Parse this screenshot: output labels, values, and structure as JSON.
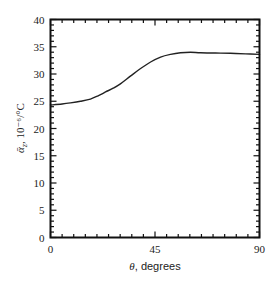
{
  "chart_data": {
    "type": "line",
    "title": "",
    "xlabel": "θ, degrees",
    "xlabel_symbol": "θ",
    "xlabel_text": ", degrees",
    "ylabel": "ᾱz, 10⁻⁶/°C",
    "ylabel_symbol": "ᾱ",
    "ylabel_sub": "z",
    "ylabel_text": ", 10⁻⁶/°C",
    "xlim": [
      0,
      90
    ],
    "ylim": [
      0,
      40
    ],
    "x_ticks": [
      0,
      45,
      90
    ],
    "x_tick_labels": [
      "0",
      "45",
      "90"
    ],
    "x_minor_step": 5,
    "y_ticks": [
      0,
      5,
      10,
      15,
      20,
      25,
      30,
      35,
      40
    ],
    "y_tick_labels": [
      "0",
      "5",
      "10",
      "15",
      "20",
      "25",
      "30",
      "35",
      "40"
    ],
    "y_minor_step": 1,
    "grid": false,
    "legend": null,
    "series": [
      {
        "name": "ᾱz",
        "color": "#222222",
        "x": [
          0,
          5,
          8.6,
          12.9,
          17.2,
          20.5,
          23.7,
          27,
          30.1,
          34.4,
          38.8,
          43.1,
          47.4,
          51.7,
          56,
          60.3,
          64.6,
          71,
          77.5,
          84,
          90
        ],
        "y": [
          24.3,
          24.5,
          24.7,
          25.0,
          25.4,
          26.0,
          26.7,
          27.4,
          28.2,
          29.6,
          31.0,
          32.2,
          33.1,
          33.6,
          33.9,
          34.0,
          33.9,
          33.85,
          33.8,
          33.7,
          33.6
        ]
      }
    ]
  },
  "colors": {
    "axis": "#111111",
    "line": "#222222",
    "background": "#ffffff"
  }
}
